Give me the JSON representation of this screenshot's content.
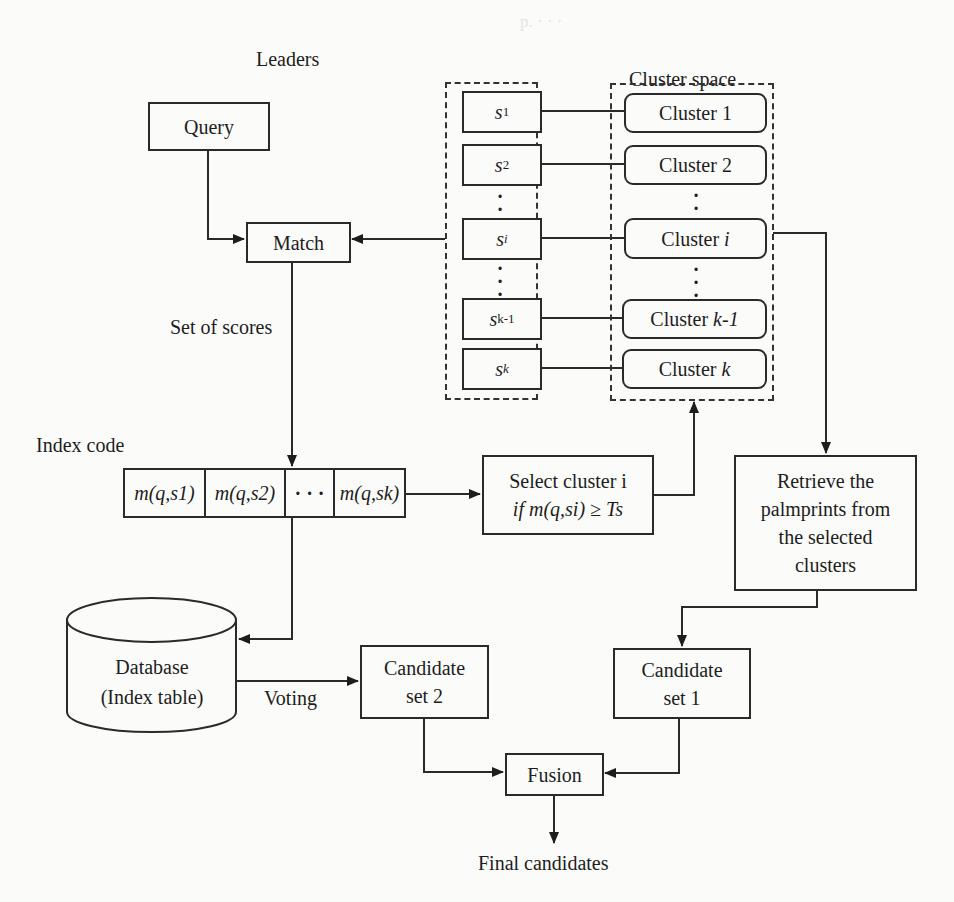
{
  "diagram": {
    "title_leaders": "Leaders",
    "title_cluster_space": "Cluster space",
    "query": "Query",
    "match": "Match",
    "set_of_scores": "Set of scores",
    "index_code_label": "Index code",
    "index_code_cells": [
      "m(q,s1)",
      "m(q,s2)",
      "· · ·",
      "m(q,sk)"
    ],
    "leaders": [
      {
        "base": "s",
        "sub": "1"
      },
      {
        "base": "s",
        "sub": "2"
      },
      {
        "base": "s",
        "sub": "i"
      },
      {
        "base": "s",
        "sub": "k-1"
      },
      {
        "base": "s",
        "sub": "k"
      }
    ],
    "clusters": [
      {
        "prefix": "Cluster ",
        "idx": "1"
      },
      {
        "prefix": "Cluster ",
        "idx": "2"
      },
      {
        "prefix": "Cluster ",
        "idx": "i"
      },
      {
        "prefix": "Cluster ",
        "idx": "k-1"
      },
      {
        "prefix": "Cluster ",
        "idx": "k"
      }
    ],
    "select_line1": "Select cluster i",
    "select_line2": "if m(q,si) ≥ Ts",
    "retrieve": [
      "Retrieve the",
      "palmprints from",
      "the selected",
      "clusters"
    ],
    "database": [
      "Database",
      "(Index table)"
    ],
    "voting": "Voting",
    "candidate_set_2": [
      "Candidate",
      "set 2"
    ],
    "candidate_set_1": [
      "Candidate",
      "set 1"
    ],
    "fusion": "Fusion",
    "final_candidates": "Final candidates"
  }
}
